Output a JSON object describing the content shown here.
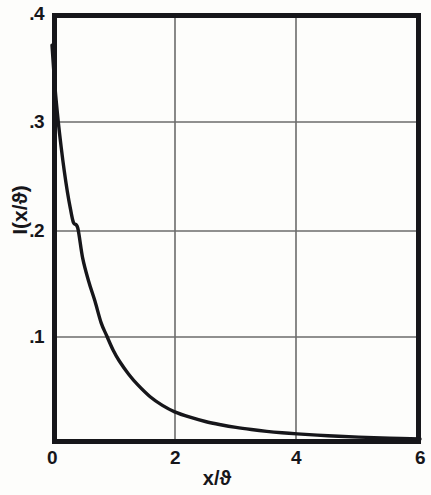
{
  "figure": {
    "background_color": "#fdfdfb",
    "ink_color": "#16161a",
    "grid_color": "#6b6b6b"
  },
  "axes": {
    "y_label": "I(x/ϑ)",
    "x_label": "x/ϑ",
    "y_ticks": [
      {
        "value": 0.4,
        "label": ".4"
      },
      {
        "value": 0.3,
        "label": ".3"
      },
      {
        "value": 0.2,
        "label": ".2"
      },
      {
        "value": 0.1,
        "label": ".1"
      }
    ],
    "x_ticks": [
      {
        "value": 0,
        "label": "0"
      },
      {
        "value": 2,
        "label": "2"
      },
      {
        "value": 4,
        "label": "4"
      },
      {
        "value": 6,
        "label": "6"
      }
    ]
  },
  "chart_data": {
    "type": "line",
    "title": "",
    "xlabel": "x/ϑ",
    "ylabel": "I(x/ϑ)",
    "xlim": [
      0,
      6
    ],
    "ylim": [
      0,
      0.4
    ],
    "grid": true,
    "grid_x": [
      2,
      4
    ],
    "grid_y": [
      0.1,
      0.2,
      0.3
    ],
    "legend": null,
    "series": [
      {
        "name": "I(x/ϑ)",
        "x": [
          0.0,
          0.05,
          0.1,
          0.15,
          0.2,
          0.25,
          0.3,
          0.35,
          0.42,
          0.5,
          0.6,
          0.7,
          0.8,
          0.89,
          1.0,
          1.1,
          1.25,
          1.4,
          1.6,
          1.8,
          2.0,
          2.25,
          2.5,
          2.75,
          3.0,
          3.25,
          3.5,
          3.75,
          4.0,
          4.5,
          5.0,
          5.5,
          6.0
        ],
        "y": [
          0.37,
          0.33,
          0.3,
          0.275,
          0.253,
          0.234,
          0.218,
          0.205,
          0.2,
          0.172,
          0.15,
          0.132,
          0.112,
          0.1,
          0.086,
          0.076,
          0.064,
          0.054,
          0.043,
          0.035,
          0.029,
          0.024,
          0.02,
          0.017,
          0.0145,
          0.0125,
          0.0108,
          0.0095,
          0.0085,
          0.0068,
          0.0055,
          0.0045,
          0.0038
        ]
      }
    ]
  },
  "geometry": {
    "plot_left": 52,
    "plot_right": 420,
    "plot_top": 13,
    "plot_bottom": 443,
    "y_value_at_top": 0.4,
    "y_value_at_bottom": 0.0
  }
}
